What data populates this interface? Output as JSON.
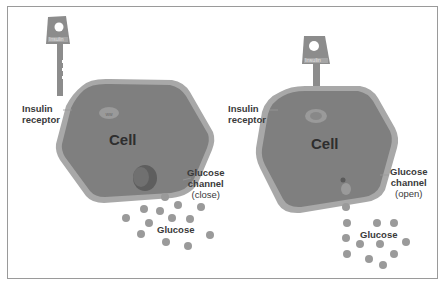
{
  "diagram": {
    "left_panel": {
      "key_label": "Insulin",
      "receptor_label_line1": "Insulin",
      "receptor_label_line2": "receptor",
      "cell_label": "Cell",
      "channel_label_line1": "Glucose",
      "channel_label_line2": "channel",
      "channel_state": "(close)",
      "glucose_label": "Glucose"
    },
    "right_panel": {
      "key_label": "Insulin",
      "receptor_label_line1": "Insulin",
      "receptor_label_line2": "receptor",
      "cell_label": "Cell",
      "channel_label_line1": "Glucose",
      "channel_label_line2": "channel",
      "channel_state": "(open)",
      "glucose_label": "Glucose"
    },
    "colors": {
      "cell_fill": "#7f7f7f",
      "cell_membrane": "#a8a8a8",
      "key": "#8c8c8c",
      "glucose": "#9a9a9a",
      "label": "#3a3a3a"
    }
  }
}
